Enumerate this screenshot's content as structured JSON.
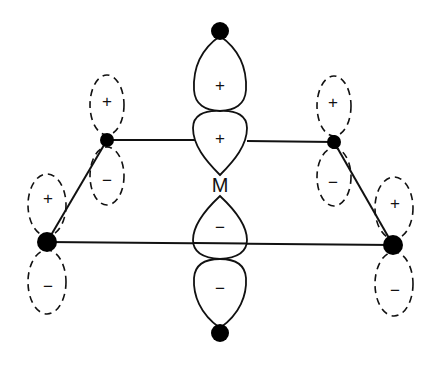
{
  "diagram": {
    "type": "molecular-orbital-overlap",
    "colors": {
      "line": "#111111",
      "background": "#ffffff"
    },
    "metal": {
      "label": "M"
    },
    "central_orbital": {
      "lobes": [
        {
          "position": "top-outer",
          "sign": "+"
        },
        {
          "position": "top-inner",
          "sign": "+"
        },
        {
          "position": "bottom-inner",
          "sign": "−"
        },
        {
          "position": "bottom-outer",
          "sign": "−"
        }
      ]
    },
    "ligand_orbitals": [
      {
        "position": "upper-left",
        "upper_sign": "+",
        "lower_sign": "−"
      },
      {
        "position": "upper-right",
        "upper_sign": "+",
        "lower_sign": "−"
      },
      {
        "position": "lower-left",
        "upper_sign": "+",
        "lower_sign": "−"
      },
      {
        "position": "lower-right",
        "upper_sign": "+",
        "lower_sign": "−"
      }
    ]
  }
}
